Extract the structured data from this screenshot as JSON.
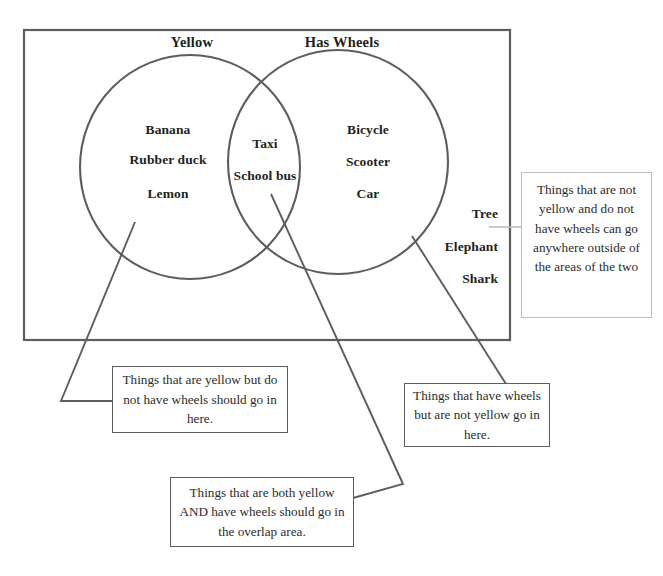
{
  "diagram": {
    "type": "venn-diagram",
    "universe_label": "",
    "sets": [
      {
        "id": "yellow",
        "title": "Yellow",
        "items": [
          "Banana",
          "Rubber duck",
          "Lemon"
        ]
      },
      {
        "id": "has-wheels",
        "title": "Has Wheels",
        "items": [
          "Bicycle",
          "Scooter",
          "Car"
        ]
      }
    ],
    "intersection": {
      "id": "yellow-and-wheels",
      "items": [
        "Taxi",
        "School bus"
      ]
    },
    "outside": {
      "id": "neither",
      "items": [
        "Tree",
        "Elephant",
        "Shark"
      ]
    }
  },
  "titles": {
    "left_circle": "Yellow",
    "right_circle": "Has Wheels"
  },
  "left_only_items": {
    "item_1": "Banana",
    "item_2": "Rubber duck",
    "item_3": "Lemon"
  },
  "intersection_items": {
    "item_1": "Taxi",
    "item_2": "School bus"
  },
  "right_only_items": {
    "item_1": "Bicycle",
    "item_2": "Scooter",
    "item_3": "Car"
  },
  "outside_items": {
    "item_1": "Tree",
    "item_2": "Elephant",
    "item_3": "Shark"
  },
  "callouts": {
    "left": "Things that are yellow but do not have wheels should go in here.",
    "middle": "Things that are both yellow AND have wheels should go in the overlap area.",
    "right": "Things that have wheels but are not yellow go in here.",
    "outside": "Things that are not yellow and do not have wheels can go anywhere outside of the areas of the two"
  },
  "colors": {
    "stroke": "#5d5d5d",
    "text": "#231f20",
    "callout_text": "#2b2b2b",
    "soft_border": "#bcbcbc",
    "background": "#ffffff"
  }
}
